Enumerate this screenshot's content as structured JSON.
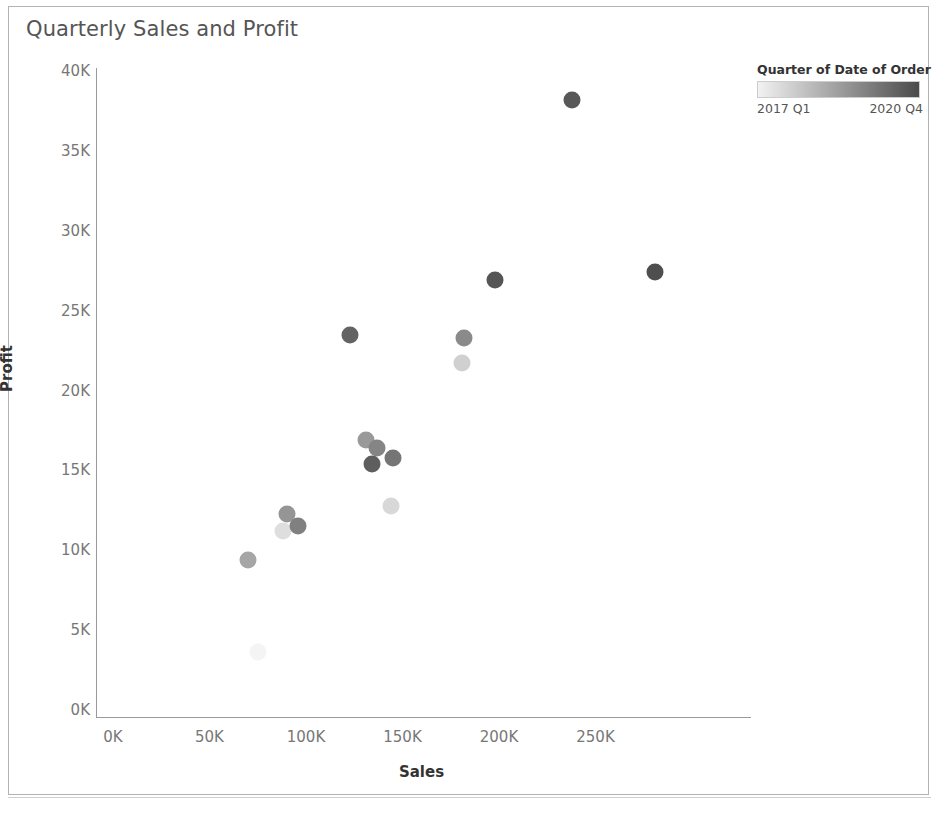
{
  "chart_title": "Quarterly Sales and Profit",
  "legend": {
    "title": "Quarter of Date of Order",
    "min_label": "2017 Q1",
    "max_label": "2020 Q4",
    "color_start": "#f2f2f2",
    "color_end": "#4a4a4a"
  },
  "axes": {
    "x_label": "Sales",
    "y_label": "Profit",
    "x_ticks": [
      "0K",
      "50K",
      "100K",
      "150K",
      "200K",
      "250K"
    ],
    "y_ticks": [
      "40K",
      "35K",
      "30K",
      "25K",
      "20K",
      "15K",
      "10K",
      "5K",
      "0K"
    ]
  },
  "chart_data": {
    "type": "scatter",
    "title": "Quarterly Sales and Profit",
    "xlabel": "Sales",
    "ylabel": "Profit",
    "xlim": [
      0,
      290000
    ],
    "ylim": [
      0,
      40000
    ],
    "x_ticks": [
      0,
      50000,
      100000,
      150000,
      200000,
      250000
    ],
    "y_ticks": [
      0,
      5000,
      10000,
      15000,
      20000,
      25000,
      30000,
      35000,
      40000
    ],
    "grid": false,
    "legend_position": "top-right",
    "color_legend": {
      "title": "Quarter of Date of Order",
      "min": "2017 Q1",
      "max": "2020 Q4",
      "scale": "sequential-gray"
    },
    "points": [
      {
        "label": "2017 Q1",
        "x": 75000,
        "y": 3600,
        "shade": 0.04,
        "color": "#f4f4f4"
      },
      {
        "label": "2017 Q2",
        "x": 70000,
        "y": 9400,
        "shade": 0.42,
        "color": "#a6a6a6"
      },
      {
        "label": "2017 Q3",
        "x": 88000,
        "y": 11200,
        "shade": 0.14,
        "color": "#dedede"
      },
      {
        "label": "2017 Q4",
        "x": 90000,
        "y": 12300,
        "shade": 0.52,
        "color": "#959595"
      },
      {
        "label": "2018 Q1",
        "x": 96000,
        "y": 11500,
        "shade": 0.62,
        "color": "#808080"
      },
      {
        "label": "2018 Q2",
        "x": 131000,
        "y": 16900,
        "shade": 0.5,
        "color": "#999999"
      },
      {
        "label": "2018 Q3",
        "x": 137000,
        "y": 16400,
        "shade": 0.6,
        "color": "#858585"
      },
      {
        "label": "2018 Q4",
        "x": 134000,
        "y": 15400,
        "shade": 0.8,
        "color": "#5e5e5e"
      },
      {
        "label": "2019 Q1",
        "x": 145000,
        "y": 15800,
        "shade": 0.68,
        "color": "#757575"
      },
      {
        "label": "2019 Q2",
        "x": 144000,
        "y": 12800,
        "shade": 0.18,
        "color": "#d8d8d8"
      },
      {
        "label": "2019 Q3",
        "x": 123000,
        "y": 23500,
        "shade": 0.78,
        "color": "#636363"
      },
      {
        "label": "2019 Q4",
        "x": 181000,
        "y": 21700,
        "shade": 0.22,
        "color": "#d0d0d0"
      },
      {
        "label": "2020 Q1",
        "x": 182000,
        "y": 23300,
        "shade": 0.58,
        "color": "#8a8a8a"
      },
      {
        "label": "2020 Q2",
        "x": 198000,
        "y": 26900,
        "shade": 0.86,
        "color": "#555555"
      },
      {
        "label": "2020 Q3",
        "x": 238000,
        "y": 38200,
        "shade": 0.84,
        "color": "#585858"
      },
      {
        "label": "2020 Q4",
        "x": 281000,
        "y": 27400,
        "shade": 0.9,
        "color": "#4e4e4e"
      }
    ]
  }
}
